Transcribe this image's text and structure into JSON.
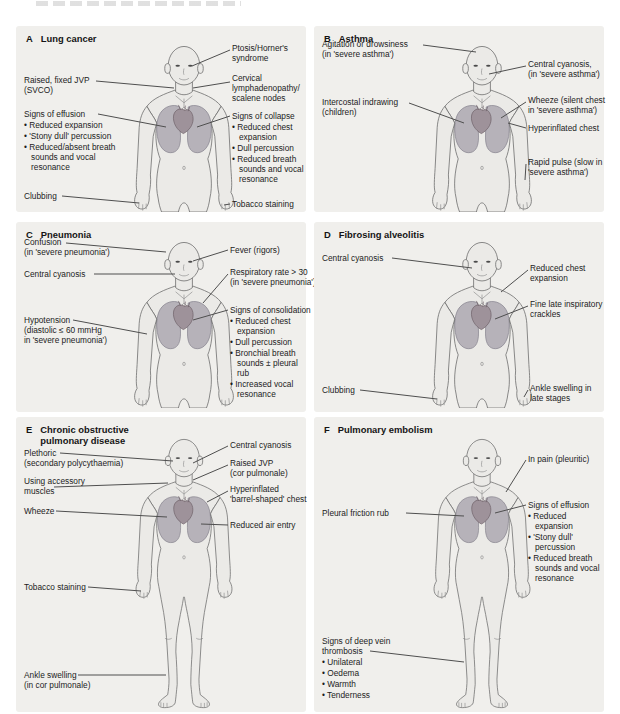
{
  "colors": {
    "panel_bg": "#f0efec",
    "body_fill": "#ebeae7",
    "body_stroke": "#6a6a6a",
    "lung_fill": "#b6b2b9",
    "lung_stroke": "#84818c",
    "heart_fill": "#9e929a",
    "heart_stroke": "#6e6269",
    "leader_line": "#4f4f4f",
    "text": "#1c1c1c"
  },
  "panels": [
    {
      "letter": "A",
      "title": "Lung cancer",
      "labels": {
        "raised_jvp": "Raised, fixed JVP\n(SVCO)",
        "signs_effusion": "Signs of effusion",
        "signs_effusion_bullets": [
          "Reduced expansion",
          "'Stony dull' percussion",
          "Reduced/absent breath sounds and vocal resonance"
        ],
        "clubbing": "Clubbing",
        "ptosis": "Ptosis/Horner's\nsyndrome",
        "cervical": "Cervical\nlymphadenopathy/\nscalene nodes",
        "signs_collapse": "Signs of collapse",
        "signs_collapse_bullets": [
          "Reduced chest expansion",
          "Dull percussion",
          "Reduced breath sounds and vocal resonance"
        ],
        "tobacco": "Tobacco staining"
      }
    },
    {
      "letter": "B",
      "title": "Asthma",
      "labels": {
        "agitation": "Agitation or drowsiness\n(in 'severe asthma')",
        "intercostal": "Intercostal indrawing\n(children)",
        "central_cyanosis": "Central cyanosis,\n(in 'severe asthma')",
        "wheeze": "Wheeze (silent chest\nin 'severe asthma')",
        "hyperinflated": "Hyperinflated chest",
        "rapid_pulse": "Rapid pulse (slow in\n'severe asthma')"
      }
    },
    {
      "letter": "C",
      "title": "Pneumonia",
      "labels": {
        "confusion": "Confusion\n(in 'severe pneumonia')",
        "central_cyanosis": "Central cyanosis",
        "hypotension": "Hypotension\n(diastolic ≤ 60 mmHg\nin 'severe pneumonia')",
        "fever": "Fever (rigors)",
        "resp_rate": "Respiratory rate > 30\n(in 'severe pneumonia')",
        "consolidation": "Signs of consolidation",
        "consolidation_bullets": [
          "Reduced chest expansion",
          "Dull percussion",
          "Bronchial breath sounds ± pleural rub",
          "Increased vocal resonance"
        ]
      }
    },
    {
      "letter": "D",
      "title": "Fibrosing alveolitis",
      "labels": {
        "central_cyanosis": "Central cyanosis",
        "clubbing": "Clubbing",
        "reduced_chest": "Reduced chest\nexpansion",
        "crackles": "Fine late inspiratory\ncrackles",
        "ankle_swelling": "Ankle swelling in\nlate stages"
      }
    },
    {
      "letter": "E",
      "title": "Chronic obstructive\npulmonary disease",
      "labels": {
        "plethoric": "Plethoric\n(secondary polycythaemia)",
        "accessory": "Using accessory\nmuscles",
        "wheeze": "Wheeze",
        "tobacco": "Tobacco staining",
        "ankle_swelling": "Ankle swelling\n(in cor pulmonale)",
        "central_cyanosis": "Central cyanosis",
        "raised_jvp": "Raised JVP\n(cor pulmonale)",
        "hyperinflated": "Hyperinflated\n'barrel-shaped' chest",
        "reduced_air": "Reduced air entry"
      }
    },
    {
      "letter": "F",
      "title": "Pulmonary embolism",
      "labels": {
        "pleural_rub": "Pleural friction rub",
        "dvt": "Signs of deep vein\nthrombosis",
        "dvt_bullets": [
          "Unilateral",
          "Oedema",
          "Warmth",
          "Tenderness"
        ],
        "in_pain": "In pain (pleuritic)",
        "effusion": "Signs of effusion",
        "effusion_bullets": [
          "Reduced expansion",
          "'Stony dull' percussion",
          "Reduced breath sounds and vocal resonance"
        ]
      }
    }
  ]
}
